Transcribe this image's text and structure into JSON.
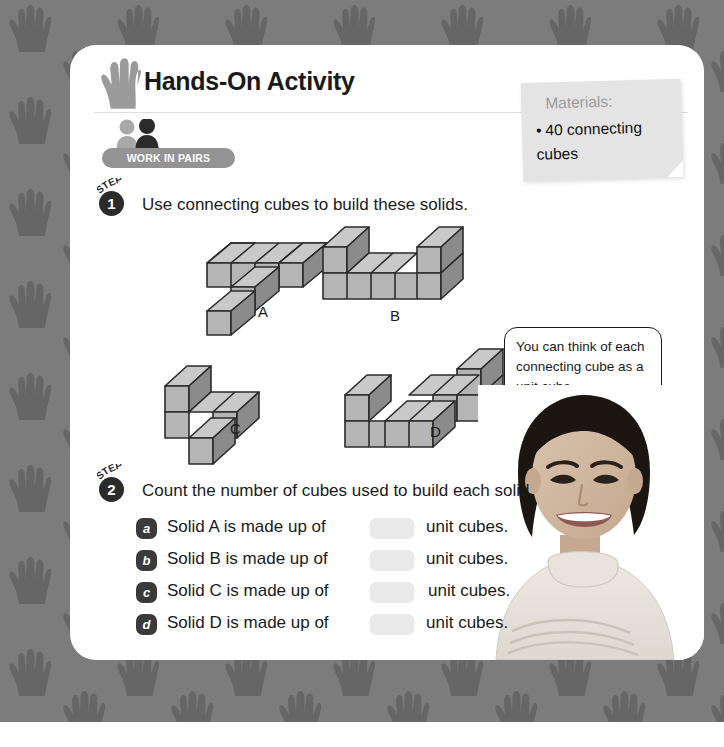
{
  "page": {
    "background_color": "#7c7c7c",
    "pattern": "handprints",
    "card_color": "#ffffff"
  },
  "header": {
    "icon": "hand-icon",
    "title": "Hands-On Activity",
    "pair_icon": "two-people-icon",
    "pairs_badge": "WORK IN PAIRS"
  },
  "materials": {
    "heading": "Materials:",
    "bullet": "•",
    "item": "40 connecting cubes"
  },
  "steps": [
    {
      "word": "STEP",
      "number": "1",
      "text": "Use connecting cubes to build these solids."
    },
    {
      "word": "STEP",
      "number": "2",
      "text": "Count the number of cubes used to build each solid."
    }
  ],
  "solids": [
    {
      "label": "A"
    },
    {
      "label": "B"
    },
    {
      "label": "C"
    },
    {
      "label": "D"
    }
  ],
  "bubble": {
    "text": "You can think of each connecting cube as a unit cube."
  },
  "photo": {
    "alt": "smiling girl student photo"
  },
  "answers": [
    {
      "marker": "a",
      "prefix": "Solid A is made up of",
      "value": "",
      "suffix": "unit cubes."
    },
    {
      "marker": "b",
      "prefix": "Solid B is made up of",
      "value": "",
      "suffix": "unit cubes."
    },
    {
      "marker": "c",
      "prefix": "Solid C is made up of",
      "value": "",
      "suffix": "unit cubes."
    },
    {
      "marker": "d",
      "prefix": "Solid D is made up of",
      "value": "",
      "suffix": "unit cubes."
    }
  ],
  "colors": {
    "cube_top": "#c9c9c9",
    "cube_front": "#b5b5b5",
    "cube_side": "#8b8b8b",
    "cube_outline": "#2b2b2b",
    "badge": "#939393",
    "marker": "#3a3a3a",
    "blank": "#e9e9e9"
  }
}
